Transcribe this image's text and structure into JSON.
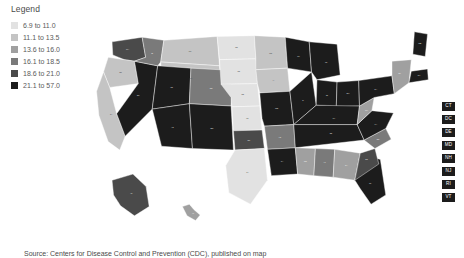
{
  "legend": {
    "title": "Legend",
    "classes": [
      {
        "label": "6.9 to 11.0",
        "color": "#e2e2e2"
      },
      {
        "label": "11.1 to 13.5",
        "color": "#c4c4c4"
      },
      {
        "label": "13.6 to 16.0",
        "color": "#a0a0a0"
      },
      {
        "label": "16.1 to 18.5",
        "color": "#7a7a7a"
      },
      {
        "label": "18.6 to 21.0",
        "color": "#4a4a4a"
      },
      {
        "label": "21.1 to 57.0",
        "color": "#1c1c1c"
      }
    ]
  },
  "map": {
    "type": "choropleth",
    "region": "United States",
    "background": "#ffffff",
    "border_color": "#ffffff",
    "states": [
      {
        "abbr": "WA",
        "class_index": 4,
        "color": "#4a4a4a"
      },
      {
        "abbr": "OR",
        "class_index": 1,
        "color": "#c4c4c4"
      },
      {
        "abbr": "CA",
        "class_index": 1,
        "color": "#c4c4c4"
      },
      {
        "abbr": "NV",
        "class_index": 5,
        "color": "#1c1c1c"
      },
      {
        "abbr": "ID",
        "class_index": 3,
        "color": "#7a7a7a"
      },
      {
        "abbr": "MT",
        "class_index": 1,
        "color": "#c4c4c4"
      },
      {
        "abbr": "WY",
        "class_index": 1,
        "color": "#c4c4c4"
      },
      {
        "abbr": "UT",
        "class_index": 5,
        "color": "#1c1c1c"
      },
      {
        "abbr": "AZ",
        "class_index": 5,
        "color": "#1c1c1c"
      },
      {
        "abbr": "CO",
        "class_index": 3,
        "color": "#7a7a7a"
      },
      {
        "abbr": "NM",
        "class_index": 5,
        "color": "#1c1c1c"
      },
      {
        "abbr": "ND",
        "class_index": 0,
        "color": "#e2e2e2"
      },
      {
        "abbr": "SD",
        "class_index": 0,
        "color": "#e2e2e2"
      },
      {
        "abbr": "NE",
        "class_index": 0,
        "color": "#e2e2e2"
      },
      {
        "abbr": "KS",
        "class_index": 0,
        "color": "#e2e2e2"
      },
      {
        "abbr": "OK",
        "class_index": 4,
        "color": "#4a4a4a"
      },
      {
        "abbr": "TX",
        "class_index": 0,
        "color": "#e2e2e2"
      },
      {
        "abbr": "MN",
        "class_index": 1,
        "color": "#c4c4c4"
      },
      {
        "abbr": "IA",
        "class_index": 1,
        "color": "#c4c4c4"
      },
      {
        "abbr": "MO",
        "class_index": 5,
        "color": "#1c1c1c"
      },
      {
        "abbr": "AR",
        "class_index": 3,
        "color": "#7a7a7a"
      },
      {
        "abbr": "LA",
        "class_index": 5,
        "color": "#1c1c1c"
      },
      {
        "abbr": "WI",
        "class_index": 5,
        "color": "#1c1c1c"
      },
      {
        "abbr": "IL",
        "class_index": 5,
        "color": "#1c1c1c"
      },
      {
        "abbr": "MI",
        "class_index": 5,
        "color": "#1c1c1c"
      },
      {
        "abbr": "IN",
        "class_index": 5,
        "color": "#1c1c1c"
      },
      {
        "abbr": "OH",
        "class_index": 5,
        "color": "#1c1c1c"
      },
      {
        "abbr": "KY",
        "class_index": 5,
        "color": "#1c1c1c"
      },
      {
        "abbr": "TN",
        "class_index": 5,
        "color": "#1c1c1c"
      },
      {
        "abbr": "MS",
        "class_index": 2,
        "color": "#a0a0a0"
      },
      {
        "abbr": "AL",
        "class_index": 3,
        "color": "#7a7a7a"
      },
      {
        "abbr": "GA",
        "class_index": 2,
        "color": "#a0a0a0"
      },
      {
        "abbr": "FL",
        "class_index": 5,
        "color": "#1c1c1c"
      },
      {
        "abbr": "SC",
        "class_index": 4,
        "color": "#4a4a4a"
      },
      {
        "abbr": "NC",
        "class_index": 3,
        "color": "#7a7a7a"
      },
      {
        "abbr": "VA",
        "class_index": 5,
        "color": "#1c1c1c"
      },
      {
        "abbr": "WV",
        "class_index": 2,
        "color": "#a0a0a0"
      },
      {
        "abbr": "PA",
        "class_index": 5,
        "color": "#1c1c1c"
      },
      {
        "abbr": "NY",
        "class_index": 2,
        "color": "#a0a0a0"
      },
      {
        "abbr": "ME",
        "class_index": 5,
        "color": "#1c1c1c"
      },
      {
        "abbr": "MA",
        "class_index": 5,
        "color": "#1c1c1c"
      },
      {
        "abbr": "AK",
        "class_index": 4,
        "color": "#4a4a4a"
      },
      {
        "abbr": "HI",
        "class_index": 2,
        "color": "#a0a0a0"
      }
    ],
    "callouts": [
      {
        "abbr": "CT",
        "color": "#1c1c1c"
      },
      {
        "abbr": "DC",
        "color": "#1c1c1c"
      },
      {
        "abbr": "DE",
        "color": "#1c1c1c"
      },
      {
        "abbr": "MD",
        "color": "#1c1c1c"
      },
      {
        "abbr": "NH",
        "color": "#1c1c1c"
      },
      {
        "abbr": "NJ",
        "color": "#1c1c1c"
      },
      {
        "abbr": "RI",
        "color": "#1c1c1c"
      },
      {
        "abbr": "VT",
        "color": "#1c1c1c"
      }
    ]
  },
  "caption": {
    "text": "Source: Centers for Disease Control and Prevention (CDC), published on map"
  }
}
